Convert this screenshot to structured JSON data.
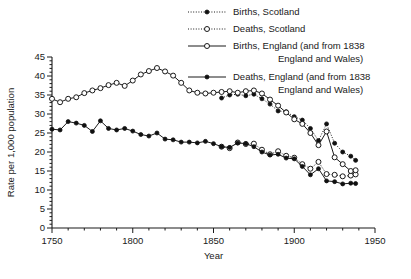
{
  "chart_data": {
    "type": "line",
    "title": "",
    "xlabel": "Year",
    "ylabel": "Rate per 1,000 population",
    "xlim": [
      1750,
      1950
    ],
    "ylim": [
      0,
      45
    ],
    "xticks": [
      1750,
      1800,
      1850,
      1900,
      1950
    ],
    "xtick_labels": [
      "1750",
      "1800",
      "1850",
      "1900",
      "1950"
    ],
    "xminor_step": 10,
    "yticks": [
      0,
      5,
      10,
      15,
      20,
      25,
      30,
      35,
      40,
      45
    ],
    "ytick_labels": [
      "0",
      "5",
      "10",
      "15",
      "20",
      "25",
      "30",
      "35",
      "40",
      "45"
    ],
    "yminor_step": 1,
    "grid": false,
    "legend_position": "top-right",
    "series": [
      {
        "name": "births-scotland",
        "label": "Births, Scotland",
        "marker": "filled-circle",
        "line": "dotted",
        "x": [
          1855,
          1860,
          1865,
          1870,
          1875,
          1880,
          1885,
          1890,
          1895,
          1900,
          1905,
          1910,
          1915,
          1920,
          1925,
          1930,
          1935,
          1938
        ],
        "y": [
          34.2,
          35.0,
          35.2,
          34.8,
          35.2,
          34.0,
          32.6,
          30.8,
          30.6,
          29.3,
          28.4,
          26.2,
          23.0,
          27.4,
          22.3,
          20.0,
          18.9,
          17.8
        ]
      },
      {
        "name": "deaths-scotland",
        "label": "Deaths, Scotland",
        "marker": "open-circle",
        "line": "dotted",
        "x": [
          1855,
          1860,
          1865,
          1870,
          1875,
          1880,
          1885,
          1890,
          1895,
          1900,
          1905,
          1910,
          1915,
          1920,
          1925,
          1930,
          1935,
          1938
        ],
        "y": [
          21.4,
          21.0,
          22.5,
          22.1,
          22.2,
          20.6,
          19.4,
          20.2,
          19.0,
          18.5,
          16.8,
          15.6,
          17.4,
          14.2,
          14.0,
          13.6,
          13.8,
          14.1
        ]
      },
      {
        "name": "births-england",
        "label": "Births, England (and from 1838 England and Wales)",
        "marker": "open-circle",
        "line": "solid",
        "x": [
          1750,
          1755,
          1760,
          1765,
          1770,
          1775,
          1780,
          1785,
          1790,
          1795,
          1800,
          1805,
          1810,
          1815,
          1820,
          1825,
          1830,
          1835,
          1840,
          1845,
          1850,
          1855,
          1860,
          1865,
          1870,
          1875,
          1880,
          1885,
          1890,
          1895,
          1900,
          1905,
          1910,
          1915,
          1920,
          1925,
          1930,
          1935,
          1938
        ],
        "y": [
          34.0,
          33.1,
          34.0,
          34.4,
          35.5,
          36.2,
          36.8,
          37.6,
          38.2,
          37.4,
          38.8,
          40.4,
          41.3,
          42.1,
          41.2,
          40.1,
          38.2,
          36.2,
          35.6,
          35.4,
          35.6,
          35.8,
          36.0,
          35.6,
          36.0,
          36.2,
          35.4,
          33.8,
          32.2,
          30.4,
          28.6,
          27.4,
          25.0,
          21.8,
          25.4,
          18.6,
          16.8,
          15.0,
          15.2
        ]
      },
      {
        "name": "deaths-england",
        "label": "Deaths, England (and from 1838 England and Wales)",
        "marker": "filled-circle",
        "line": "solid",
        "x": [
          1750,
          1755,
          1760,
          1765,
          1770,
          1775,
          1780,
          1785,
          1790,
          1795,
          1800,
          1805,
          1810,
          1815,
          1820,
          1825,
          1830,
          1835,
          1840,
          1845,
          1850,
          1855,
          1860,
          1865,
          1870,
          1875,
          1880,
          1885,
          1890,
          1895,
          1900,
          1905,
          1910,
          1915,
          1920,
          1925,
          1930,
          1935,
          1938
        ],
        "y": [
          26.0,
          25.8,
          28.0,
          27.6,
          27.0,
          25.4,
          28.2,
          26.2,
          25.8,
          26.2,
          25.5,
          24.6,
          24.2,
          25.0,
          23.4,
          23.2,
          22.6,
          22.6,
          22.4,
          22.8,
          22.2,
          21.4,
          21.2,
          22.4,
          22.2,
          21.4,
          20.0,
          19.2,
          19.4,
          18.4,
          18.2,
          16.2,
          14.0,
          15.6,
          12.4,
          12.2,
          11.6,
          11.8,
          11.7
        ]
      }
    ]
  },
  "legend": {
    "entries": [
      {
        "label": "Births, Scotland",
        "marker": "filled-circle",
        "line": "dotted"
      },
      {
        "label": "Deaths, Scotland",
        "marker": "open-circle",
        "line": "dotted"
      },
      {
        "label": "Births, England (and from 1838",
        "label2": "England and Wales)",
        "marker": "open-circle",
        "line": "solid"
      },
      {
        "label": "Deaths, England (and from 1838",
        "label2": "England and Wales)",
        "marker": "filled-circle",
        "line": "solid"
      }
    ]
  }
}
